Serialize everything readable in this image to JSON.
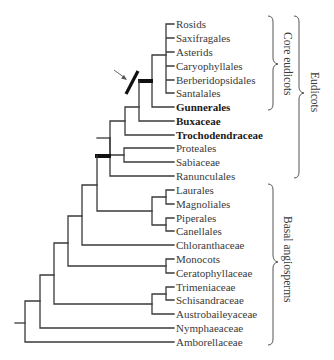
{
  "figure": {
    "type": "phylogenetic-tree",
    "taxa": [
      {
        "label": "Rosids",
        "bold": false
      },
      {
        "label": "Saxifragales",
        "bold": false
      },
      {
        "label": "Asterids",
        "bold": false
      },
      {
        "label": "Caryophyllales",
        "bold": false
      },
      {
        "label": "Berberidopsidales",
        "bold": false
      },
      {
        "label": "Santalales",
        "bold": false
      },
      {
        "label": "Gunnerales",
        "bold": true
      },
      {
        "label": "Buxaceae",
        "bold": true
      },
      {
        "label": "Trochodendraceae",
        "bold": true
      },
      {
        "label": "Proteales",
        "bold": false
      },
      {
        "label": "Sabiaceae",
        "bold": false
      },
      {
        "label": "Ranunculales",
        "bold": false
      },
      {
        "label": "Laurales",
        "bold": false
      },
      {
        "label": "Magnoliales",
        "bold": false
      },
      {
        "label": "Piperales",
        "bold": false
      },
      {
        "label": "Canellales",
        "bold": false
      },
      {
        "label": "Chloranthaceae",
        "bold": false
      },
      {
        "label": "Monocots",
        "bold": false
      },
      {
        "label": "Ceratophyllaceae",
        "bold": false
      },
      {
        "label": "Trimeniaceae",
        "bold": false
      },
      {
        "label": "Schisandraceae",
        "bold": false
      },
      {
        "label": "Austrobaileyaceae",
        "bold": false
      },
      {
        "label": "Nymphaeaceae",
        "bold": false
      },
      {
        "label": "Amborellaceae",
        "bold": false
      }
    ],
    "groups": {
      "core_eudicots": "Core eudicots",
      "eudicots": "Eudicots",
      "basal_angiosperms": "Basal angiosperms"
    },
    "annotations": {
      "arrow": "arrow pointing to slash mark on core eudicot stem"
    },
    "colors": {
      "line": "#3a3a3a",
      "thick_bar": "#111111",
      "text": "#3a3a3a"
    }
  }
}
